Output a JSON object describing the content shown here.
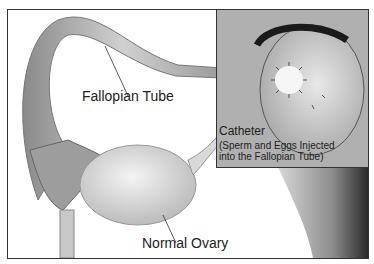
{
  "labels": {
    "fallopian_tube": "Fallopian Tube",
    "normal_ovary": "Normal Ovary",
    "catheter": "Catheter",
    "catheter_note_line1": "(Sperm and Eggs Injected",
    "catheter_note_line2": "into the Fallopian Tube)"
  }
}
